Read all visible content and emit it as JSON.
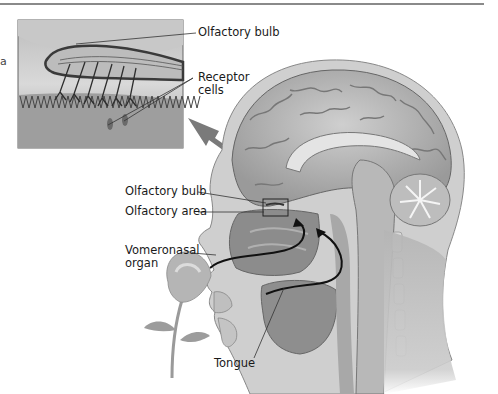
{
  "figure": {
    "edge_text": "a",
    "inset_labels": {
      "olfactory_bulb": "Olfactory bulb",
      "receptor_cells_line1": "Receptor",
      "receptor_cells_line2": "cells"
    },
    "main_labels": {
      "olfactory_bulb": "Olfactory bulb",
      "olfactory_area": "Olfactory area",
      "vomeronasal_line1": "Vomeronasal",
      "vomeronasal_line2": "organ",
      "tongue": "Tongue"
    }
  },
  "colors": {
    "line": "#8a8a8a",
    "label": "#1a1a1a",
    "arrow": "#777777",
    "airflow": "#111111"
  }
}
